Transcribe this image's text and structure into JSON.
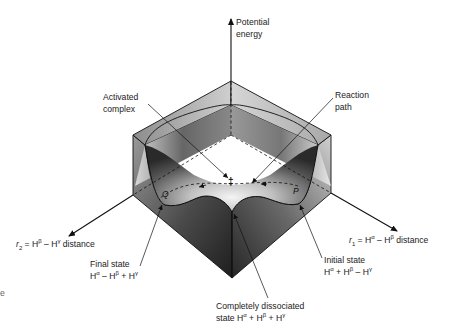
{
  "diagram": {
    "type": "3D potential energy surface",
    "labels": {
      "vertical_axis": [
        "Potential",
        "energy"
      ],
      "activated_complex": [
        "Activated",
        "complex"
      ],
      "reaction_path": [
        "Reaction",
        "path"
      ],
      "r2_axis": {
        "var": "r",
        "sub": "2",
        "text": " = H",
        "sup1": "β",
        "mid": " – H",
        "sup2": "γ",
        "tail": " distance"
      },
      "r1_axis": {
        "var": "r",
        "sub": "1",
        "text": " = H",
        "sup1": "α",
        "mid": " – H",
        "sup2": "β",
        "tail": " distance"
      },
      "final_state": {
        "line1": "Final state",
        "line2_a": "H",
        "sup_a": "α",
        "line2_b": " – H",
        "sup_b": "β",
        "line2_c": " + H",
        "sup_c": "γ"
      },
      "initial_state": {
        "line1": "Initial state",
        "line2_a": "H",
        "sup_a": "α",
        "line2_b": " + H",
        "sup_b": "β",
        "line2_c": " – H",
        "sup_c": "γ"
      },
      "dissociated_state": {
        "line1": "Completely dissociated",
        "line2_a": "state H",
        "sup_a": "α",
        "line2_b": " + H",
        "sup_b": "β",
        "line2_c": " + H",
        "sup_c": "γ"
      },
      "point_Q": "Q",
      "point_P": "P",
      "saddle_marker": "‡",
      "edge_fragment": "e"
    },
    "colors": {
      "line": "#111111",
      "surface_dark": "#2a2a2a",
      "surface_light": "#e8e8e8",
      "top_face": "#bdbdbd"
    }
  }
}
